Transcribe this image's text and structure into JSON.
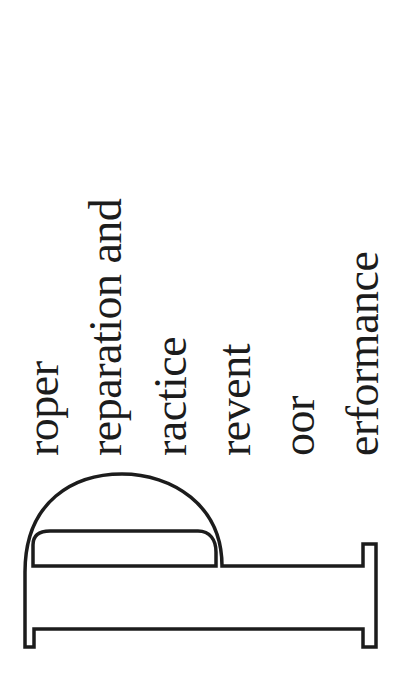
{
  "poster": {
    "drop_cap": "P",
    "lines": [
      "roper",
      "reparation and",
      "ractice",
      "revent",
      "oor",
      "erformance"
    ],
    "colors": {
      "ink": "#1c1c1c",
      "background": "#ffffff"
    }
  }
}
